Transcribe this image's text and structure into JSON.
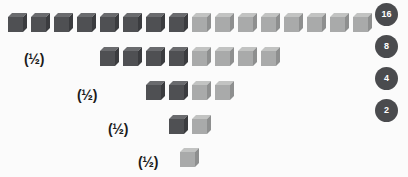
{
  "diagram": {
    "background_color": "#fbfbfb",
    "cube_dark_color": "#4f5053",
    "cube_light_color": "#a9aaaa",
    "badge_color": "#4a4b4e",
    "badge_text_color": "#ffffff",
    "label_color": "#1b1b1b",
    "rows": [
      {
        "total": 16,
        "dark_count": 8,
        "light_count": 8,
        "label": "",
        "badge": "16",
        "start_x": 8,
        "y": 13,
        "step": 23
      },
      {
        "total": 8,
        "dark_count": 4,
        "light_count": 4,
        "label": "(½)",
        "label_x": 24,
        "label_y": 52,
        "badge": "8",
        "start_x": 100,
        "y": 47,
        "step": 23
      },
      {
        "total": 4,
        "dark_count": 2,
        "light_count": 2,
        "label": "(½)",
        "label_x": 77,
        "label_y": 88,
        "badge": "4",
        "start_x": 146,
        "y": 81,
        "step": 23
      },
      {
        "total": 2,
        "dark_count": 1,
        "light_count": 1,
        "label": "(½)",
        "label_x": 108,
        "label_y": 122,
        "badge": "2",
        "start_x": 169,
        "y": 115,
        "step": 23
      },
      {
        "total": 1,
        "dark_count": 0,
        "light_count": 1,
        "label": "(½)",
        "label_x": 138,
        "label_y": 155,
        "badge": "",
        "start_x": 180,
        "y": 148,
        "step": 23
      }
    ],
    "badges": [
      {
        "value": "16",
        "x": 375,
        "y": 3
      },
      {
        "value": "8",
        "x": 375,
        "y": 35
      },
      {
        "value": "4",
        "x": 375,
        "y": 67
      },
      {
        "value": "2",
        "x": 375,
        "y": 99
      }
    ]
  },
  "chart_data": {
    "type": "bar",
    "categories": [
      "16",
      "8",
      "4",
      "2",
      "1"
    ],
    "values": [
      16,
      8,
      4,
      2,
      1
    ],
    "series": [
      {
        "name": "dark cubes",
        "values": [
          8,
          4,
          2,
          1,
          0
        ]
      },
      {
        "name": "light cubes",
        "values": [
          8,
          4,
          2,
          1,
          1
        ]
      }
    ],
    "annotations": [
      "(½)",
      "(½)",
      "(½)",
      "(½)"
    ],
    "legend_labels": [
      "16",
      "8",
      "4",
      "2"
    ],
    "xlabel": "",
    "ylabel": "",
    "grid": false
  }
}
